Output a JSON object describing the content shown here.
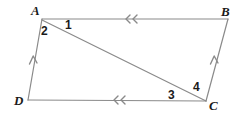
{
  "figure": {
    "width": 241,
    "height": 116,
    "background_color": "#ffffff",
    "stroke_color": "#8a8a8a",
    "stroke_width": 1.2,
    "text_color": "#1a1a1a"
  },
  "vertices": [
    {
      "id": "A",
      "label": "A",
      "x": 42,
      "y": 19,
      "label_x": 31,
      "label_y": 5
    },
    {
      "id": "B",
      "label": "B",
      "x": 228,
      "y": 19,
      "label_x": 221,
      "label_y": 6
    },
    {
      "id": "C",
      "label": "C",
      "x": 206,
      "y": 101,
      "label_x": 208,
      "label_y": 99
    },
    {
      "id": "D",
      "label": "D",
      "x": 28,
      "y": 100,
      "label_x": 14,
      "label_y": 94
    }
  ],
  "edges": [
    {
      "id": "AB",
      "from": "A",
      "to": "B",
      "x1": 42,
      "y1": 19,
      "x2": 228,
      "y2": 19,
      "ticks": 2
    },
    {
      "id": "BC",
      "from": "B",
      "to": "C",
      "x1": 228,
      "y1": 19,
      "x2": 206,
      "y2": 101,
      "ticks": 1
    },
    {
      "id": "DC",
      "from": "D",
      "to": "C",
      "x1": 28,
      "y1": 100,
      "x2": 206,
      "y2": 101,
      "ticks": 2
    },
    {
      "id": "AD",
      "from": "A",
      "to": "D",
      "x1": 42,
      "y1": 19,
      "x2": 28,
      "y2": 100,
      "ticks": 1
    }
  ],
  "diagonal": {
    "id": "AC",
    "from": "A",
    "to": "C",
    "x1": 42,
    "y1": 20,
    "x2": 206,
    "y2": 101
  },
  "arrow_marks": [
    {
      "id": "AB-mark-1",
      "edge": "AB",
      "x": 130,
      "y": 19,
      "direction": "left",
      "kind": "double-chevron"
    },
    {
      "id": "DC-mark-1",
      "edge": "DC",
      "x": 118,
      "y": 100,
      "direction": "left",
      "kind": "double-chevron"
    },
    {
      "id": "AD-mark-1",
      "edge": "AD",
      "x": 33,
      "y": 60,
      "direction": "up",
      "kind": "single-chevron"
    },
    {
      "id": "BC-mark-1",
      "edge": "BC",
      "x": 214,
      "y": 60,
      "direction": "up",
      "kind": "single-chevron"
    }
  ],
  "angle_labels": [
    {
      "id": "angle-1",
      "label": "1",
      "x": 65,
      "y": 19
    },
    {
      "id": "angle-2",
      "label": "2",
      "x": 41,
      "y": 25
    },
    {
      "id": "angle-3",
      "label": "3",
      "x": 168,
      "y": 90
    },
    {
      "id": "angle-4",
      "label": "4",
      "x": 193,
      "y": 82
    }
  ]
}
